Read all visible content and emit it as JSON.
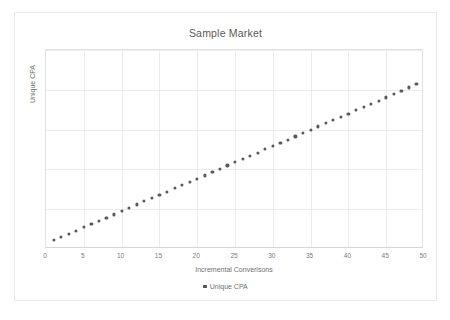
{
  "chart_data": {
    "type": "scatter",
    "title": "Sample Market",
    "xlabel": "Incremental Converisons",
    "ylabel": "Unique CPA",
    "legend": [
      "Unique CPA"
    ],
    "legend_position": "bottom",
    "grid": true,
    "xlim": [
      0,
      50
    ],
    "ylim": [
      0,
      5
    ],
    "xticks": [
      0,
      5,
      10,
      15,
      20,
      25,
      30,
      35,
      40,
      45,
      50
    ],
    "xtick_labels": [
      "0",
      "5",
      "10",
      "15",
      "20",
      "25",
      "30",
      "35",
      "40",
      "45",
      "50"
    ],
    "yticks": [
      0,
      1,
      2,
      3,
      4,
      5
    ],
    "ytick_labels": [
      "",
      "",
      "",
      "",
      "",
      ""
    ],
    "series": [
      {
        "name": "Unique CPA",
        "marker": "circle",
        "color": "#595959",
        "x": [
          1,
          2,
          3,
          4,
          5,
          6,
          7,
          8,
          9,
          10,
          11,
          12,
          13,
          14,
          15,
          16,
          17,
          18,
          19,
          20,
          21,
          22,
          23,
          24,
          25,
          26,
          27,
          28,
          29,
          30,
          31,
          32,
          33,
          34,
          35,
          36,
          37,
          38,
          39,
          40,
          41,
          42,
          43,
          44,
          45,
          46,
          47,
          48,
          49
        ],
        "y": [
          0.22,
          0.3,
          0.38,
          0.46,
          0.55,
          0.63,
          0.71,
          0.79,
          0.87,
          0.95,
          1.04,
          1.12,
          1.2,
          1.28,
          1.36,
          1.44,
          1.53,
          1.61,
          1.69,
          1.77,
          1.85,
          1.93,
          2.02,
          2.1,
          2.18,
          2.26,
          2.34,
          2.42,
          2.51,
          2.59,
          2.67,
          2.75,
          2.83,
          2.91,
          3.0,
          3.08,
          3.16,
          3.24,
          3.32,
          3.4,
          3.49,
          3.57,
          3.65,
          3.73,
          3.81,
          3.89,
          3.98,
          4.06,
          4.14
        ]
      }
    ]
  },
  "colors": {
    "marker": "#595959",
    "grid": "#ececec",
    "axis": "#d6d6d6",
    "text": "#6f6f6f",
    "title_text": "#5a5a5a",
    "frame": "#e8e8e8"
  }
}
